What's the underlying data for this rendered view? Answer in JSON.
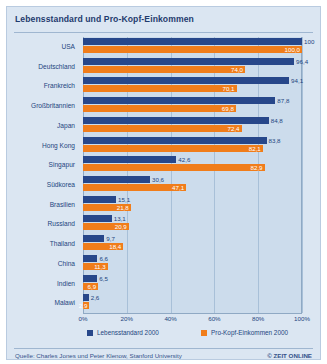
{
  "header": {
    "title": "Lebensstandard und Pro-Kopf-Einkommen"
  },
  "footer": {
    "source": "Quelle: Charles Jones und Peter Klenow, Stanford University",
    "credit": "© ZEIT ONLINE"
  },
  "colors": {
    "series_blue": "#27478a",
    "series_orange": "#f07d1b",
    "plot_bg": "#ccdcec",
    "card_bg": "#dbe6f2",
    "label_blue": "#23457e"
  },
  "chart_data": {
    "type": "bar",
    "orientation": "horizontal",
    "title": "Lebensstandard und Pro-Kopf-Einkommen",
    "xlabel": "",
    "ylabel": "",
    "xlim": [
      0,
      100
    ],
    "xticks": [
      "0%",
      "20%",
      "40%",
      "60%",
      "80%",
      "100%"
    ],
    "xtick_values": [
      0,
      20,
      40,
      60,
      80,
      100
    ],
    "grid": true,
    "legend_position": "bottom",
    "categories": [
      "USA",
      "Deutschland",
      "Frankreich",
      "Großbritannien",
      "Japan",
      "Hong Kong",
      "Singapur",
      "Südkorea",
      "Brasilien",
      "Russland",
      "Thailand",
      "China",
      "Indien",
      "Malawi"
    ],
    "series": [
      {
        "name": "Lebensstandard 2000",
        "color": "#27478a",
        "values": [
          100,
          96.4,
          94.1,
          87.8,
          84.8,
          83.8,
          42.6,
          30.6,
          15.1,
          13.1,
          9.7,
          6.6,
          6.5,
          2.6
        ],
        "labels": [
          "100",
          "96,4",
          "94,1",
          "87,8",
          "84,8",
          "83,8",
          "42,6",
          "30,6",
          "15,1",
          "13,1",
          "9,7",
          "6,6",
          "6,5",
          "2,6"
        ],
        "label_placement": [
          "outside",
          "outside",
          "outside",
          "outside",
          "outside",
          "outside",
          "outside",
          "outside",
          "outside",
          "outside",
          "outside",
          "outside",
          "outside",
          "outside"
        ]
      },
      {
        "name": "Pro-Kopf-Einkommen 2000",
        "color": "#f07d1b",
        "values": [
          100.0,
          74.0,
          70.1,
          69.8,
          72.4,
          82.1,
          82.9,
          47.1,
          21.8,
          20.9,
          18.4,
          11.3,
          6.9,
          2.9
        ],
        "labels": [
          "100,0",
          "74,0",
          "70,1",
          "69,8",
          "72,4",
          "82,1",
          "82,9",
          "47,1",
          "21,8",
          "20,9",
          "18,4",
          "11,3",
          "6,9",
          "2,9"
        ],
        "label_placement": [
          "inside",
          "inside",
          "inside",
          "inside",
          "inside",
          "inside",
          "inside",
          "inside",
          "inside",
          "inside",
          "inside",
          "inside",
          "inside",
          "inside"
        ]
      }
    ]
  }
}
